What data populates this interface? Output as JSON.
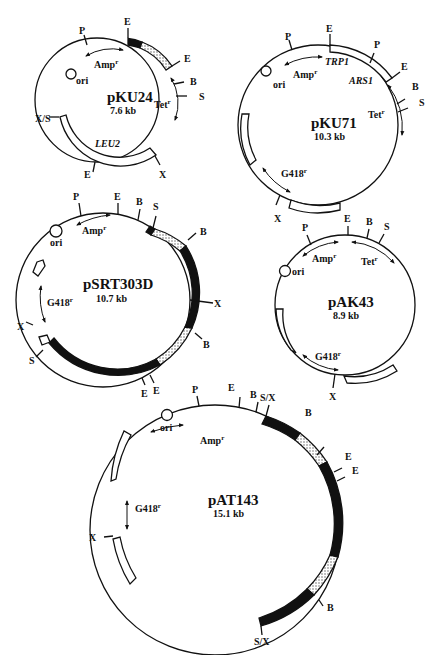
{
  "figure": {
    "plasmids": [
      {
        "name": "pKU24",
        "size": "7.6 kb",
        "sites": [
          "E",
          "E",
          "B",
          "S",
          "X",
          "E",
          "X/S",
          "P"
        ],
        "markers": [
          "Amp",
          "Tet",
          "LEU2",
          "ori"
        ]
      },
      {
        "name": "pKU71",
        "size": "10.3 kb",
        "sites": [
          "E",
          "P",
          "E",
          "B",
          "S",
          "X",
          "P"
        ],
        "markers": [
          "TRP1",
          "ARS1",
          "Amp",
          "Tet",
          "G418",
          "ori"
        ]
      },
      {
        "name": "pSRT303D",
        "size": "10.7 kb",
        "sites": [
          "P",
          "E",
          "B",
          "S",
          "B",
          "X",
          "B",
          "E",
          "E",
          "S",
          "X"
        ],
        "markers": [
          "Amp",
          "G418",
          "ori"
        ]
      },
      {
        "name": "pAK43",
        "size": "8.9 kb",
        "sites": [
          "P",
          "E",
          "B",
          "S",
          "X"
        ],
        "markers": [
          "Amp",
          "Tet",
          "G418",
          "ori"
        ]
      },
      {
        "name": "pAT143",
        "size": "15.1 kb",
        "sites": [
          "P",
          "E",
          "B",
          "S/X",
          "B",
          "E",
          "E",
          "B",
          "S/X",
          "X"
        ],
        "markers": [
          "Amp",
          "G418",
          "ori"
        ]
      }
    ]
  },
  "labels": {
    "p1": {
      "name": "pKU24",
      "size": "7.6 kb",
      "amp": "Amp",
      "tet": "Tet",
      "leu": "LEU2",
      "ori": "ori",
      "r": "r",
      "s_E1": "E",
      "s_E2": "E",
      "s_B": "B",
      "s_S": "S",
      "s_X": "X",
      "s_E3": "E",
      "s_XS": "X/S",
      "s_P": "P"
    },
    "p2": {
      "name": "pKU71",
      "size": "10.3 kb",
      "amp": "Amp",
      "tet": "Tet",
      "trp": "TRP1",
      "ars": "ARS1",
      "g418": "G418",
      "ori": "ori",
      "r": "r",
      "s_E1": "E",
      "s_P2": "P",
      "s_E2": "E",
      "s_B": "B",
      "s_S": "S",
      "s_X": "X",
      "s_P": "P"
    },
    "p3": {
      "name": "pSRT303D",
      "size": "10.7 kb",
      "amp": "Amp",
      "g418": "G418",
      "ori": "ori",
      "r": "r",
      "s_P": "P",
      "s_E": "E",
      "s_B": "B",
      "s_S": "S",
      "s_B2": "B",
      "s_X": "X",
      "s_B3": "B",
      "s_E2": "E",
      "s_E3": "E",
      "s_S2": "S",
      "s_X2": "X"
    },
    "p4": {
      "name": "pAK43",
      "size": "8.9 kb",
      "amp": "Amp",
      "tet": "Tet",
      "g418": "G418",
      "ori": "ori",
      "r": "r",
      "s_P": "P",
      "s_E": "E",
      "s_B": "B",
      "s_S": "S",
      "s_X": "X"
    },
    "p5": {
      "name": "pAT143",
      "size": "15.1 kb",
      "amp": "Amp",
      "g418": "G418",
      "ori": "ori",
      "r": "r",
      "s_P": "P",
      "s_E": "E",
      "s_B": "B",
      "s_SX": "S/X",
      "s_B2": "B",
      "s_E2": "E",
      "s_E3": "E",
      "s_B3": "B",
      "s_SX2": "S/X",
      "s_X": "X"
    }
  },
  "colors": {
    "ink": "#111111",
    "background": "#ffffff",
    "stipple": "#cfcfcf"
  }
}
